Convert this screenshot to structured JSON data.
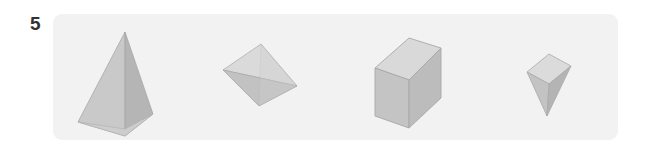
{
  "question": {
    "number": "5"
  },
  "panel": {
    "background_color": "#f2f2f2",
    "page_background_color": "#ffffff"
  },
  "figures": [
    {
      "id": "pyramid",
      "name": "square-pyramid",
      "label": "Square pyramid (apex up)",
      "faces": [
        {
          "name": "left-face",
          "color": "#c9c9c9"
        },
        {
          "name": "right-face",
          "color": "#b5b5b5"
        },
        {
          "name": "base-edge-face",
          "color": "#cccccc"
        }
      ],
      "edge_color": "#a8a8a8"
    },
    {
      "id": "tetrahedron",
      "name": "tetrahedron",
      "label": "Tetrahedron (tilted)",
      "faces": [
        {
          "name": "top-face",
          "color": "#dadada"
        },
        {
          "name": "lower-left-face",
          "color": "#c2c2c2"
        },
        {
          "name": "lower-right-face",
          "color": "#cfcfcf"
        }
      ],
      "edge_color": "#aaaaaa"
    },
    {
      "id": "cube",
      "name": "cube",
      "label": "Cube",
      "faces": [
        {
          "name": "top-face",
          "color": "#d9d9d9"
        },
        {
          "name": "front-face",
          "color": "#c4c4c4"
        },
        {
          "name": "right-face",
          "color": "#bcbcbc"
        }
      ],
      "edge_color": "#a8a8a8"
    },
    {
      "id": "inverted-pyramid",
      "name": "inverted-square-pyramid",
      "label": "Square pyramid (apex down)",
      "faces": [
        {
          "name": "top-face",
          "color": "#dbdbdb"
        },
        {
          "name": "left-face",
          "color": "#c3c3c3"
        },
        {
          "name": "right-face",
          "color": "#b4b4b4"
        }
      ],
      "edge_color": "#a9a9a9"
    }
  ],
  "colors": {
    "number_text": "#333333",
    "panel_fill": "#f2f2f2"
  }
}
